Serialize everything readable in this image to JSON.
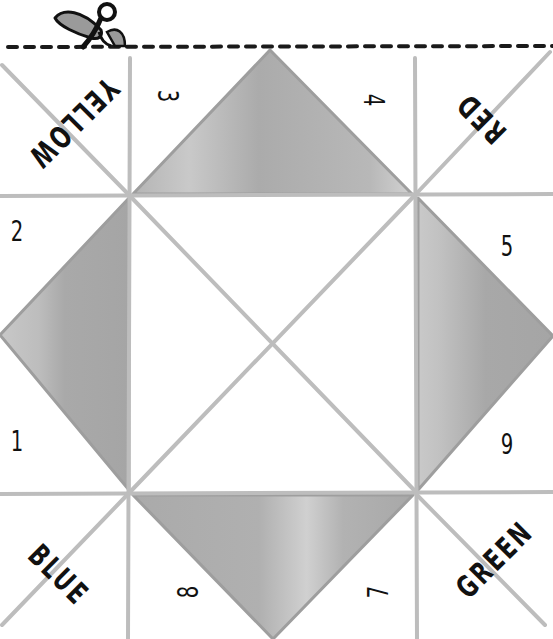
{
  "page": {
    "width": 553,
    "height": 639,
    "background": "#ffffff"
  },
  "cut_line": {
    "icon": "scissors-icon",
    "style": "dashed",
    "y": 47,
    "color": "#1a1a1a"
  },
  "colors": {
    "fold_line": "#bdbdbd",
    "flap_fill": "#a9a9a9",
    "flap_edge": "#9a9a9a",
    "ink": "#111111"
  },
  "corner_flaps": [
    {
      "position": "top-left",
      "label": "YELLOW",
      "orientation": "rotated-upside-down"
    },
    {
      "position": "top-right",
      "label": "RED",
      "orientation": "rotated-upside-down"
    },
    {
      "position": "bottom-left",
      "label": "BLUE",
      "orientation": "diagonal"
    },
    {
      "position": "bottom-right",
      "label": "GREEN",
      "orientation": "diagonal"
    }
  ],
  "inner_numbers": [
    {
      "value": "1",
      "position": "left-lower"
    },
    {
      "value": "2",
      "position": "left-upper"
    },
    {
      "value": "3",
      "position": "top-left"
    },
    {
      "value": "4",
      "position": "top-right"
    },
    {
      "value": "5",
      "position": "right-upper"
    },
    {
      "value": "6",
      "position": "right-lower"
    },
    {
      "value": "7",
      "position": "bottom-right"
    },
    {
      "value": "8",
      "position": "bottom-left"
    }
  ],
  "center_square": {
    "shaded_triangles": [
      "top",
      "right",
      "bottom",
      "left"
    ],
    "center_panels": 4
  }
}
